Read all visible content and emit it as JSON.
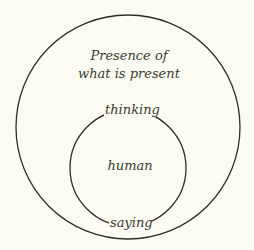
{
  "diagram": {
    "outer_label_line1": "Presence of",
    "outer_label_line2": "what is present",
    "inner_label": "human",
    "top_label": "thinking",
    "bottom_label": "saying",
    "colors": {
      "background": "#fcfcf2",
      "stroke": "#2e2e28",
      "text": "#3a3a32"
    }
  }
}
